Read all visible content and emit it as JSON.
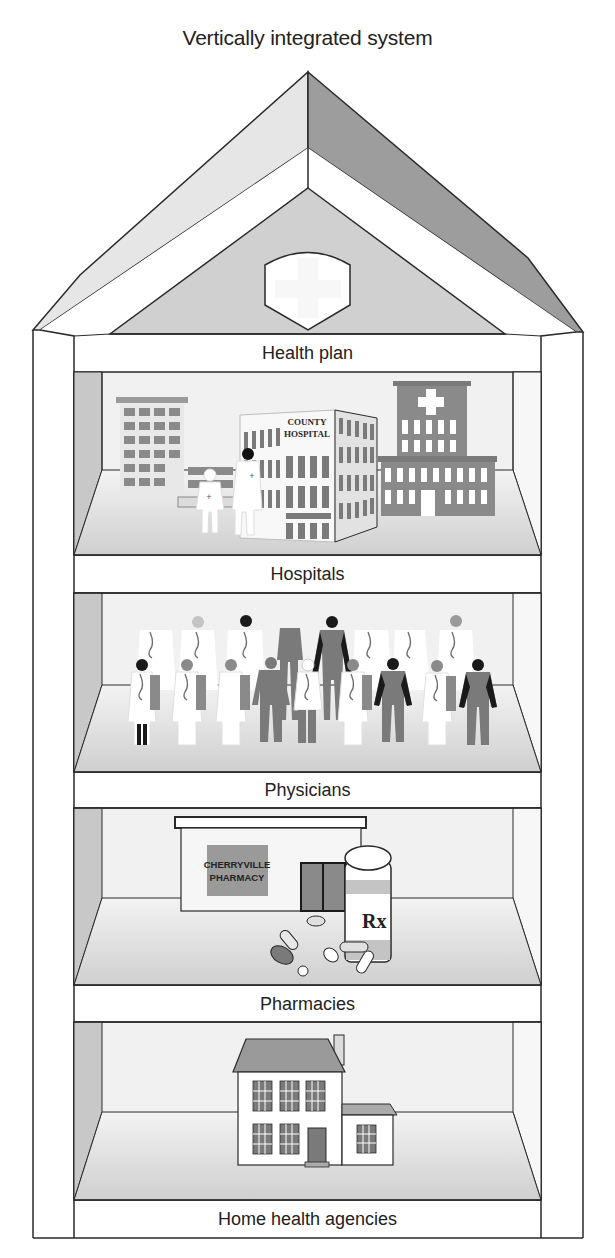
{
  "title": "Vertically integrated system",
  "floors": [
    {
      "label": "Health plan",
      "illustration": "health-plan-shield-cross"
    },
    {
      "label": "Hospitals",
      "illustration": "hospital-buildings-with-staff",
      "sign": {
        "line1": "COUNTY",
        "line2": "HOSPITAL"
      }
    },
    {
      "label": "Physicians",
      "illustration": "group-of-physicians-and-nurses"
    },
    {
      "label": "Pharmacies",
      "illustration": "pharmacy-storefront-with-pill-bottle",
      "sign": {
        "line1": "CHERRYVILLE",
        "line2": "PHARMACY"
      },
      "bottle_label": "Rx"
    },
    {
      "label": "Home health agencies",
      "illustration": "two-story-house"
    }
  ],
  "colors": {
    "line": "#2a2a2a",
    "roof_left": "#e4e4e4",
    "roof_right": "#9a9a9a",
    "attic": "#cfcfcf",
    "room_wall": "#f2f2f2",
    "room_floor": "#d6d6d6",
    "side_wall": "#c9c9c9",
    "building_gray": "#8a8a8a",
    "dark_figure": "#1a1a1a",
    "mid_figure": "#7a7a7a"
  }
}
